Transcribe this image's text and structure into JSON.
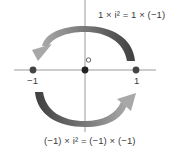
{
  "diagram": {
    "top_equation": "1 × i² = 1 × (−1)",
    "bottom_equation": "(−1) × i² = (−1) × (−1)",
    "axis_labels": {
      "neg_one": "−1",
      "pos_one": "1",
      "origin": "O"
    },
    "points": [
      {
        "name": "neg-one-point",
        "value": -1
      },
      {
        "name": "origin-point",
        "value": 0
      },
      {
        "name": "pos-one-point",
        "value": 1
      }
    ],
    "arrows": [
      {
        "name": "top-rotation-arrow",
        "from": 1,
        "to": -1,
        "direction": "counterclockwise over top"
      },
      {
        "name": "bottom-rotation-arrow",
        "from": -1,
        "to": 1,
        "direction": "counterclockwise under bottom"
      }
    ],
    "colors": {
      "axis": "#9a9a9a",
      "point": "#333333",
      "arrow_dark": "#444444",
      "arrow_light": "#9a9a9a"
    }
  }
}
